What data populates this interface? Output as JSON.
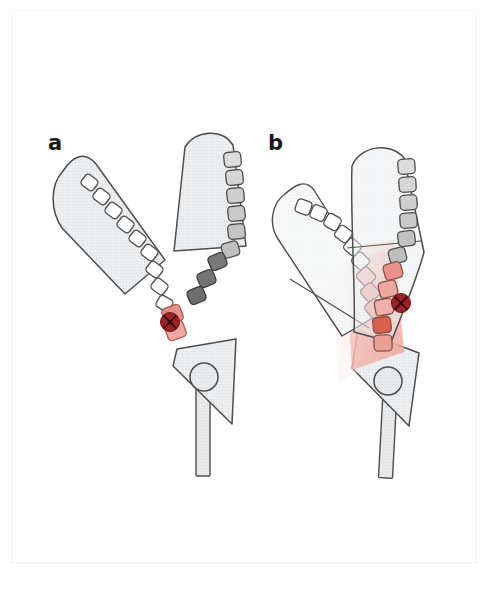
{
  "figure": {
    "background_color": "#ffffff",
    "frame_color": "#e8a89a",
    "panels": [
      {
        "id": "a",
        "label": "a",
        "label_position": {
          "x": 48,
          "y": 143
        },
        "description": "Open jaws, electrode rows uncolored except one red pair at the hinge",
        "state": "open-jaws"
      },
      {
        "id": "b",
        "label": "b",
        "label_position": {
          "x": 268,
          "y": 143
        },
        "description": "Closed jaws with red thermal-spread overlay across overlapping electrodes",
        "state": "closed-jaws-energized"
      }
    ],
    "colors": {
      "outline": "#4d4d4d",
      "tissue_fill": "#eef0f2",
      "electrode_white": "#ffffff",
      "electrode_gray_light": "#dcdcdc",
      "electrode_gray_mid": "#b9b9b9",
      "electrode_gray_dark": "#8e8e8e",
      "electrode_gray_darkest": "#6e6e6e",
      "electrode_red_light": "#f0b4ae",
      "electrode_red_mid": "#e48f86",
      "electrode_red_deep": "#d96a5d",
      "thermal_overlay": "#f3bdb6",
      "marker_red": "#9b2226",
      "handle_fill": "#e9ebed"
    },
    "markers": [
      {
        "name": "target-lesion-marker",
        "panel": "a",
        "shape": "circle-with-x",
        "cx": 170,
        "cy": 322,
        "r": 9,
        "color": "#9b2226"
      },
      {
        "name": "target-lesion-marker",
        "panel": "b",
        "shape": "circle-with-x",
        "cx": 401,
        "cy": 303,
        "r": 9,
        "color": "#9b2226"
      }
    ],
    "electrode_counts": {
      "panel_a_left_jaw": 10,
      "panel_a_right_jaw": 10,
      "panel_b_left_jaw": 10,
      "panel_b_right_jaw": 11
    },
    "caption_partial": "partially cropped caption text below the frame"
  }
}
